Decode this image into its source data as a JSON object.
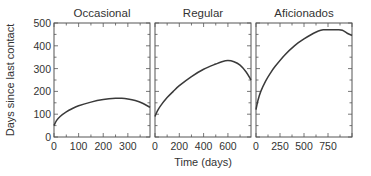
{
  "chart_data": [
    {
      "type": "line",
      "title": "Occasional",
      "xlabel": "",
      "ylabel": "Days since last contact",
      "xlim": [
        0,
        390
      ],
      "ylim": [
        0,
        500
      ],
      "xticks": [
        0,
        100,
        200,
        300
      ],
      "yticks": [
        0,
        100,
        200,
        300,
        400,
        500
      ],
      "x": [
        0,
        10,
        25,
        50,
        75,
        100,
        150,
        200,
        250,
        275,
        300,
        330,
        360,
        390
      ],
      "y": [
        50,
        72,
        90,
        110,
        125,
        137,
        153,
        164,
        170,
        170,
        167,
        160,
        148,
        130
      ]
    },
    {
      "type": "line",
      "title": "Regular",
      "xlabel": "Time (days)",
      "ylabel": "",
      "xlim": [
        0,
        790
      ],
      "ylim": [
        0,
        500
      ],
      "xticks": [
        0,
        200,
        400,
        600
      ],
      "yticks": [
        0,
        100,
        200,
        300,
        400,
        500
      ],
      "x": [
        0,
        20,
        50,
        100,
        150,
        200,
        300,
        400,
        500,
        550,
        600,
        650,
        700,
        750,
        790
      ],
      "y": [
        90,
        115,
        140,
        173,
        200,
        225,
        265,
        297,
        320,
        330,
        335,
        330,
        315,
        285,
        250
      ]
    },
    {
      "type": "line",
      "title": "Aficionados",
      "xlabel": "",
      "ylabel": "",
      "xlim": [
        0,
        1000
      ],
      "ylim": [
        0,
        500
      ],
      "xticks": [
        0,
        250,
        500,
        750
      ],
      "yticks": [
        0,
        100,
        200,
        300,
        400,
        500
      ],
      "x": [
        0,
        20,
        50,
        100,
        150,
        200,
        300,
        400,
        500,
        600,
        650,
        700,
        750,
        800,
        850,
        900,
        950,
        1000
      ],
      "y": [
        120,
        160,
        200,
        245,
        280,
        310,
        360,
        400,
        430,
        455,
        465,
        470,
        470,
        470,
        470,
        468,
        455,
        445
      ]
    }
  ],
  "axis_labels": {
    "y": "Days since last contact",
    "x": "Time (days)"
  },
  "colors": {
    "line": "#3a3a3a",
    "frame": "#555555",
    "text": "#333333"
  }
}
